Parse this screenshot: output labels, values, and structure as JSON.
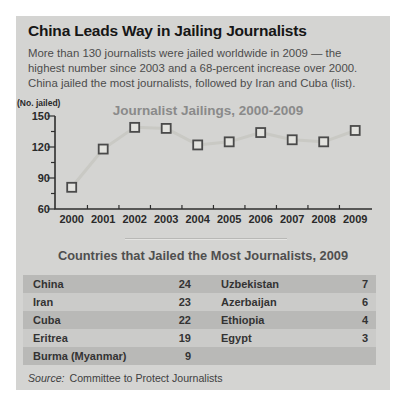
{
  "header": {
    "title": "China Leads Way in Jailing Journalists",
    "subtitle_lines": [
      "More than 130 journalists were jailed worldwide in 2009 — the",
      "highest number since 2003 and a 68-percent increase over 2000.",
      "China jailed the most journalists, followed by Iran and Cuba (list)."
    ]
  },
  "chart_data": {
    "type": "line",
    "title": "Journalist Jailings, 2000-2009",
    "ylabel": "(No. jailed)",
    "xlabel": "",
    "categories": [
      "2000",
      "2001",
      "2002",
      "2003",
      "2004",
      "2005",
      "2006",
      "2007",
      "2008",
      "2009"
    ],
    "values": [
      81,
      118,
      139,
      138,
      122,
      125,
      134,
      127,
      125,
      136
    ],
    "ylim": [
      60,
      150
    ],
    "yticks": [
      60,
      90,
      120,
      150
    ],
    "grid": false,
    "legend": "none",
    "marker": "open-square"
  },
  "table": {
    "title": "Countries that Jailed the Most Journalists, 2009",
    "rows": [
      {
        "country": "China",
        "value": "24",
        "country2": "Uzbekistan",
        "value2": "7"
      },
      {
        "country": "Iran",
        "value": "23",
        "country2": "Azerbaijan",
        "value2": "6"
      },
      {
        "country": "Cuba",
        "value": "22",
        "country2": "Ethiopia",
        "value2": "4"
      },
      {
        "country": "Eritrea",
        "value": "19",
        "country2": "Egypt",
        "value2": "3"
      },
      {
        "country": "Burma (Myanmar)",
        "value": "9",
        "country2": "",
        "value2": ""
      }
    ]
  },
  "footer": {
    "source_label": "Source:",
    "source_text": "Committee to Protect Journalists"
  },
  "colors": {
    "card_bg": "#d4d4d2",
    "headline": "#161616",
    "body_text": "#4c4c4c",
    "chart_title": "#8a8a8a",
    "axis": "#2e2e2e",
    "series_line": "#c9c9c4",
    "marker_fill": "#e3e3df",
    "marker_stroke": "#4a4a4a",
    "row_dark": "#b9b9b7",
    "row_light": "#cbcbc9",
    "table_text": "#333333"
  }
}
